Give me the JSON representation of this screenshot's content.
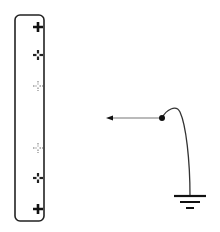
{
  "diagram": {
    "rod": {
      "x": 15,
      "y": 15,
      "width": 29,
      "height": 206,
      "radius": 5,
      "stroke": "#222222"
    },
    "charges": [
      {
        "sign": "+",
        "x": 38,
        "y": 27,
        "style": "solid",
        "color": "#111111"
      },
      {
        "sign": "+",
        "x": 38,
        "y": 55,
        "style": "broken",
        "color": "#222222"
      },
      {
        "sign": "+",
        "x": 38,
        "y": 86,
        "style": "faint",
        "color": "#9a9a9a"
      },
      {
        "sign": "+",
        "x": 38,
        "y": 148,
        "style": "faint",
        "color": "#9a9a9a"
      },
      {
        "sign": "+",
        "x": 38,
        "y": 178,
        "style": "broken",
        "color": "#222222"
      },
      {
        "sign": "+",
        "x": 38,
        "y": 209,
        "style": "solid",
        "color": "#111111"
      }
    ],
    "arrow": {
      "x1": 162,
      "y1": 118,
      "x2": 106,
      "y2": 118,
      "color": "#777777",
      "head_color": "#111111"
    },
    "junction_dot": {
      "x": 162,
      "y": 118,
      "r": 3
    },
    "wire": {
      "color": "#333333"
    },
    "ground": {
      "x": 190,
      "y": 196,
      "color": "#111111"
    }
  }
}
